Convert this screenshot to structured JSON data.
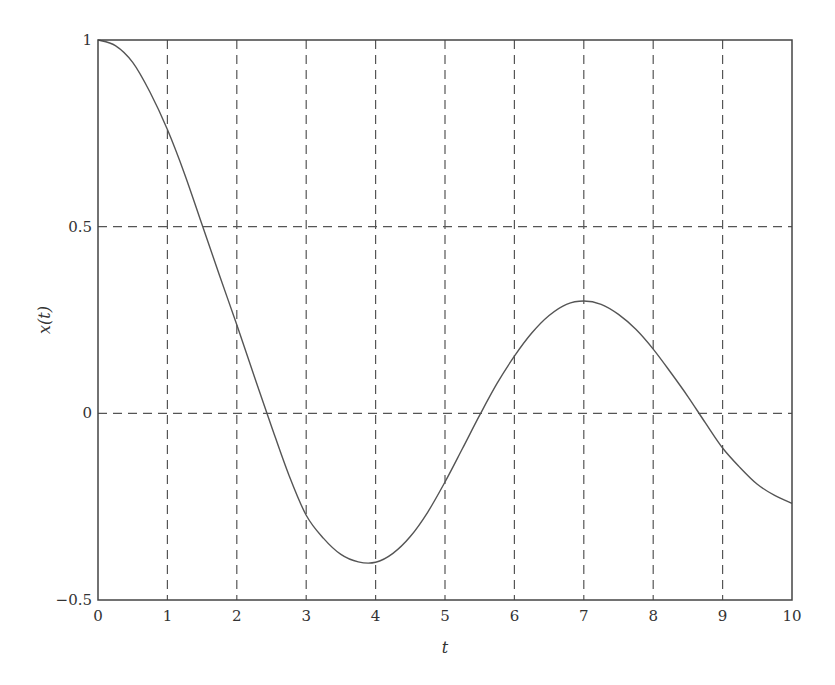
{
  "chart_data": {
    "type": "line",
    "title": "",
    "xlabel": "t",
    "ylabel": "x(t)",
    "xlim": [
      0,
      10
    ],
    "ylim": [
      -0.5,
      1
    ],
    "grid": true,
    "grid_style": "dashed",
    "legend": null,
    "x_ticks": [
      "0",
      "1",
      "2",
      "3",
      "4",
      "5",
      "6",
      "7",
      "8",
      "9",
      "10"
    ],
    "y_ticks": [
      "-0.5",
      "0",
      "0.5",
      "1"
    ],
    "series": [
      {
        "name": "x(t)",
        "color": "#555555",
        "x": [
          0,
          0.25,
          0.5,
          0.75,
          1,
          1.25,
          1.5,
          1.75,
          2,
          2.25,
          2.5,
          2.75,
          3,
          3.25,
          3.5,
          3.75,
          4,
          4.25,
          4.5,
          4.75,
          5,
          5.25,
          5.5,
          5.75,
          6,
          6.25,
          6.5,
          6.75,
          7,
          7.25,
          7.5,
          7.75,
          8,
          8.25,
          8.5,
          8.75,
          9,
          9.25,
          9.5,
          9.75,
          10
        ],
        "values": [
          1.0,
          0.985,
          0.94,
          0.86,
          0.76,
          0.64,
          0.505,
          0.37,
          0.237,
          0.1,
          -0.035,
          -0.165,
          -0.273,
          -0.335,
          -0.378,
          -0.398,
          -0.399,
          -0.375,
          -0.33,
          -0.265,
          -0.184,
          -0.095,
          -0.005,
          0.08,
          0.153,
          0.215,
          0.262,
          0.292,
          0.301,
          0.292,
          0.265,
          0.225,
          0.172,
          0.11,
          0.045,
          -0.025,
          -0.093,
          -0.145,
          -0.19,
          -0.22,
          -0.241
        ]
      }
    ]
  }
}
